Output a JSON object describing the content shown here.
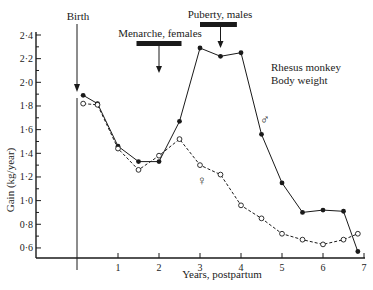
{
  "chart_data": {
    "type": "line",
    "title": "Rhesus monkey Body weight",
    "title_lines": [
      "Rhesus monkey",
      "Body weight"
    ],
    "xlabel": "Years, postpartum",
    "ylabel": "Gain (kg/year)",
    "xlim": [
      -1.0,
      7.1
    ],
    "ylim": [
      0.5,
      2.4
    ],
    "x_ticks": [
      1,
      2,
      3,
      4,
      5,
      6,
      7
    ],
    "x_tick_labels": [
      "1",
      "2",
      "3",
      "4",
      "5",
      "6",
      "7"
    ],
    "y_ticks": [
      0.6,
      0.8,
      1.0,
      1.2,
      1.4,
      1.6,
      1.8,
      2.0,
      2.2,
      2.4
    ],
    "y_tick_labels": [
      "0·6",
      "0·8",
      "1·0",
      "1·2",
      "1·4",
      "1·6",
      "1·8",
      "2·0",
      "2·2",
      "2·4"
    ],
    "grid": false,
    "series": [
      {
        "name": "Males",
        "symbol": "♂",
        "marker": "filled-circle",
        "line": "solid",
        "x": [
          0.15,
          0.5,
          1.0,
          1.5,
          2.0,
          2.5,
          3.0,
          3.5,
          4.0,
          4.5,
          5.0,
          5.5,
          6.0,
          6.5,
          6.85
        ],
        "values": [
          1.89,
          1.82,
          1.46,
          1.33,
          1.33,
          1.67,
          2.29,
          2.22,
          2.25,
          1.56,
          1.15,
          0.9,
          0.92,
          0.91,
          0.57
        ]
      },
      {
        "name": "Females",
        "symbol": "♀",
        "marker": "open-circle",
        "line": "dashed",
        "x": [
          0.15,
          0.5,
          1.0,
          1.5,
          2.0,
          2.5,
          3.0,
          3.5,
          4.0,
          4.5,
          5.0,
          5.5,
          6.0,
          6.5,
          6.85
        ],
        "values": [
          1.82,
          1.81,
          1.44,
          1.26,
          1.38,
          1.52,
          1.3,
          1.22,
          0.96,
          0.85,
          0.72,
          0.67,
          0.63,
          0.67,
          0.72
        ]
      }
    ],
    "annotations": [
      {
        "text": "Birth",
        "type": "vertical-line-arrow",
        "x": 0.0
      },
      {
        "text": "Menarche, females",
        "type": "bar-arrow",
        "bar_x": [
          1.5,
          2.5
        ],
        "arrow_x": 2.0
      },
      {
        "text": "Puberty, males",
        "type": "bar-arrow",
        "bar_x": [
          3.0,
          3.9
        ],
        "arrow_x": 3.5
      }
    ],
    "legend": "inline symbols near series (♂ upper, ♀ lower)"
  }
}
